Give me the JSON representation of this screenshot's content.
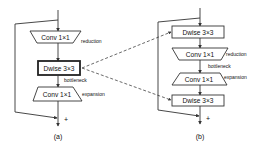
{
  "panel_a": {
    "caption": "(a)",
    "block1": {
      "label": "Conv 1×1",
      "annotation": "reduction",
      "shape": "trapezoid-narrowing"
    },
    "block2": {
      "label": "Dwise 3×3",
      "annotation": "bottleneck",
      "shape": "box-bold"
    },
    "block3": {
      "label": "Conv 1×1",
      "annotation": "expansion",
      "shape": "trapezoid-widening"
    },
    "sum_symbol": "+"
  },
  "panel_b": {
    "caption": "(b)",
    "block1": {
      "label": "Dwise 3×3",
      "shape": "box"
    },
    "block2": {
      "label": "Conv 1×1",
      "annotation": "reduction",
      "shape": "trapezoid-narrowing"
    },
    "bottleneck_label": "bottleneck",
    "block3": {
      "label": "Conv 1×1",
      "annotation": "expansion",
      "shape": "trapezoid-widening"
    },
    "block4": {
      "label": "Dwise 3×3",
      "shape": "box"
    },
    "sum_symbol": "+"
  },
  "connections": {
    "style": "dashed",
    "from": "panel_a.block2",
    "to": [
      "panel_b.block1",
      "panel_b.block4"
    ]
  },
  "colors": {
    "line": "#333333",
    "background": "#ffffff"
  }
}
